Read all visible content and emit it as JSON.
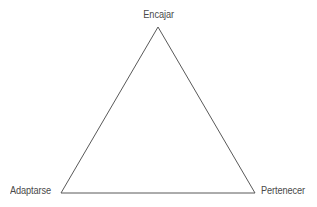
{
  "diagram": {
    "type": "triangle-diagram",
    "background_color": "#ffffff",
    "stroke_color": "#595959",
    "text_color": "#4a4a4a",
    "nodes": [
      {
        "id": "apex",
        "label": "Encajar",
        "position": "top"
      },
      {
        "id": "bottom_left",
        "label": "Adaptarse",
        "position": "bottom-left"
      },
      {
        "id": "bottom_right",
        "label": "Pertenecer",
        "position": "bottom-right"
      }
    ]
  }
}
